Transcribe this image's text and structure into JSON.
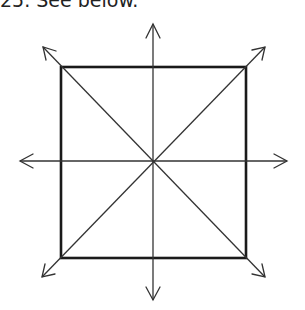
{
  "caption": "25. See below.",
  "figure": {
    "square": {
      "x1": 61,
      "y1": 67,
      "x2": 246,
      "y2": 258
    },
    "center": {
      "x": 153,
      "y": 161
    },
    "arrows": [
      {
        "name": "up",
        "to": [
          153,
          24
        ]
      },
      {
        "name": "down",
        "to": [
          153,
          300
        ]
      },
      {
        "name": "left",
        "to": [
          20,
          161
        ]
      },
      {
        "name": "right",
        "to": [
          287,
          161
        ]
      },
      {
        "name": "up-left",
        "to": [
          43,
          47
        ]
      },
      {
        "name": "up-right",
        "to": [
          265,
          47
        ]
      },
      {
        "name": "down-left",
        "to": [
          42,
          277
        ]
      },
      {
        "name": "down-right",
        "to": [
          265,
          277
        ]
      }
    ],
    "colors": {
      "line": "#1a1a1a",
      "background": "#ffffff"
    }
  }
}
